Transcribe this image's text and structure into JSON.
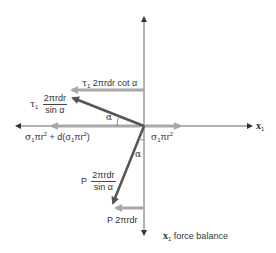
{
  "diagram": {
    "title": "x1 force balance",
    "axes": {
      "horizontal_label": "x",
      "horizontal_label_sub": "1",
      "caption_var": "x",
      "caption_sub": "1",
      "caption_text": "force balance"
    },
    "forces": {
      "shear_horizontal": {
        "prefix": "τ",
        "sub": "1",
        "text": "2πrdr cot α"
      },
      "shear_inclined": {
        "prefix": "τ",
        "sub": "1",
        "numerator": "2πrdr",
        "denominator": "sin α"
      },
      "stress_left": {
        "text_a": "σ",
        "sub_a": "1",
        "text_b": "πr",
        "sup_b": "2",
        "text_c": " + d(σ",
        "sub_c": "1",
        "text_d": "πr",
        "sup_d": "2",
        "text_e": ")"
      },
      "stress_right": {
        "text_a": "σ",
        "sub_a": "1",
        "text_b": "πr",
        "sup_b": "2"
      },
      "pressure_inclined": {
        "prefix": "P",
        "numerator": "2πrdr",
        "denominator": "sin α"
      },
      "pressure_horizontal": {
        "text": "P 2πrdr"
      }
    },
    "angles": {
      "upper": "α",
      "lower": "α"
    },
    "colors": {
      "axis": "#555555",
      "light_arrow": "#a8a8a8",
      "dark_arrow": "#555555",
      "text": "#333333"
    }
  }
}
